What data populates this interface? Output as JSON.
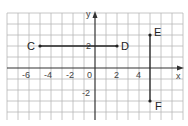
{
  "diagram": {
    "type": "coordinate-plane",
    "axes": {
      "x_label": "x",
      "y_label": "y"
    },
    "x_ticks": [
      "-6",
      "-4",
      "-2",
      "0",
      "2",
      "4"
    ],
    "y_ticks": [
      "2",
      "-2"
    ],
    "points": [
      {
        "label": "C",
        "x": -5,
        "y": 2
      },
      {
        "label": "D",
        "x": 2,
        "y": 2
      },
      {
        "label": "E",
        "x": 5,
        "y": 3
      },
      {
        "label": "F",
        "x": 5,
        "y": -3
      }
    ],
    "segments": [
      {
        "from": "C",
        "to": "D"
      },
      {
        "from": "E",
        "to": "F"
      }
    ]
  }
}
